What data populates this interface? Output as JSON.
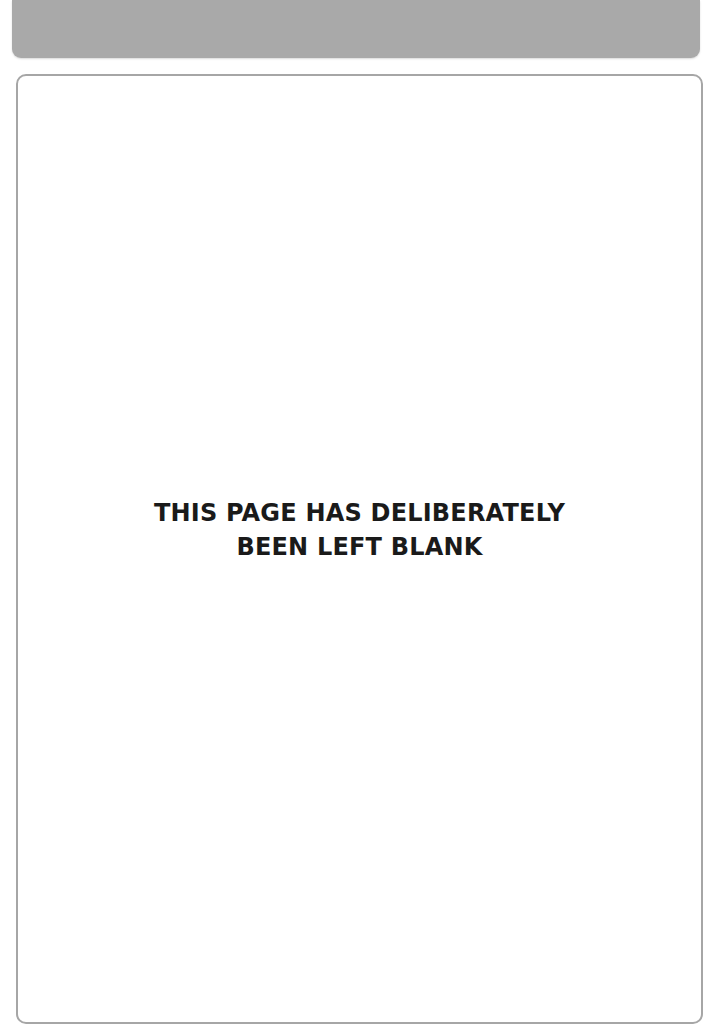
{
  "header": {
    "band_color": "#a9a9a9"
  },
  "page": {
    "border_color": "#a6a6a6",
    "notice_lines": [
      "THIS PAGE HAS DELIBERATELY",
      "BEEN LEFT BLANK"
    ]
  }
}
